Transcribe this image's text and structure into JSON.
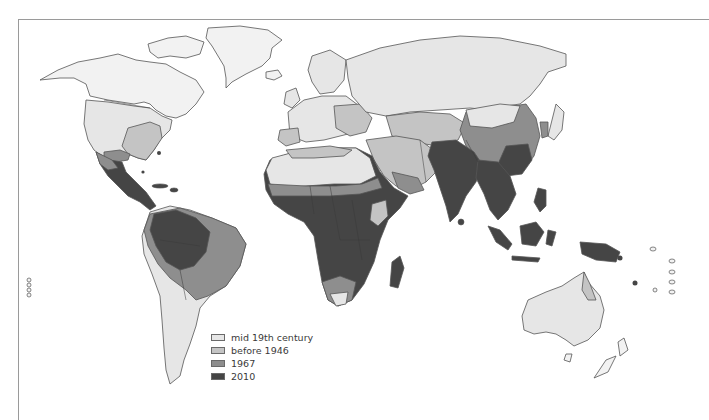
{
  "map": {
    "type": "world choropleth (grayscale)",
    "colors": {
      "mid_19th_century": "#e6e6e6",
      "before_1946": "#c4c4c4",
      "1967": "#8e8e8e",
      "2010": "#454545",
      "unshaded_land": "#f2f2f2",
      "outline": "#555555",
      "frame": "#9a9a9a"
    },
    "legend": {
      "items": [
        {
          "label": "mid 19th century",
          "color": "#e6e6e6"
        },
        {
          "label": "before 1946",
          "color": "#c4c4c4"
        },
        {
          "label": "1967",
          "color": "#8e8e8e"
        },
        {
          "label": "2010",
          "color": "#454545"
        }
      ]
    },
    "regions": [
      {
        "name": "North America (Canada/Alaska/Greenland)",
        "category": "mid 19th century"
      },
      {
        "name": "United States",
        "category": "mid 19th century"
      },
      {
        "name": "Southeastern United States",
        "category": "before 1946"
      },
      {
        "name": "Mexico / Central America",
        "category": "2010"
      },
      {
        "name": "Amazon basin / northern South America",
        "category": "2010"
      },
      {
        "name": "Eastern Brazil",
        "category": "1967"
      },
      {
        "name": "Southern South America",
        "category": "mid 19th century"
      },
      {
        "name": "Europe",
        "category": "mid 19th century"
      },
      {
        "name": "Eastern Europe / Balkans",
        "category": "before 1946"
      },
      {
        "name": "Russia / Siberia",
        "category": "mid 19th century"
      },
      {
        "name": "North Africa / Sahara",
        "category": "mid 19th century"
      },
      {
        "name": "Sahel",
        "category": "1967"
      },
      {
        "name": "Sub-Saharan Africa",
        "category": "2010"
      },
      {
        "name": "Southern Africa",
        "category": "1967"
      },
      {
        "name": "Middle East / Arabia",
        "category": "before 1946"
      },
      {
        "name": "South Asia",
        "category": "2010"
      },
      {
        "name": "Southeast Asia",
        "category": "2010"
      },
      {
        "name": "China",
        "category": "1967"
      },
      {
        "name": "Indonesia / Papua",
        "category": "2010"
      },
      {
        "name": "Australia",
        "category": "mid 19th century"
      },
      {
        "name": "New Zealand",
        "category": "unshaded"
      }
    ]
  }
}
